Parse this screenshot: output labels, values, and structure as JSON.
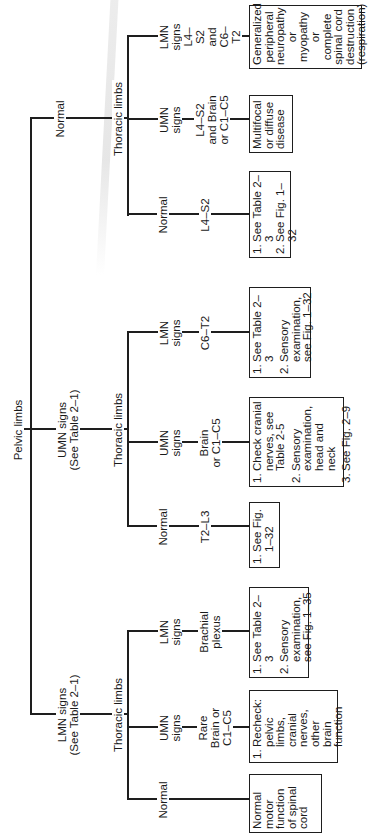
{
  "root": {
    "label": "Pelvic limbs"
  },
  "branches": [
    {
      "pelvic_label": "LMN signs\n(See Table 2–1)",
      "thoracic_label": "Thoracic limbs",
      "children": [
        {
          "sign": "LMN\nsigns",
          "location": "L4–S2\nand\nC6–T2",
          "box": "Generalized\nperipheral\nneuropathy\nor myopathy\nor\ncomplete\nspinal cord\ndestruction\n(respiration)"
        },
        {
          "sign": "UMN\nsigns",
          "location": "L4–S2\nand Brain\nor C1–C5",
          "box": "Multifocal\nor diffuse\ndisease"
        },
        {
          "sign": "Normal",
          "location": "L4–S2",
          "box_items": [
            {
              "num": "1.",
              "text": "See Table 2–3"
            },
            {
              "num": "2.",
              "text": "See Fig. 1–32"
            }
          ]
        }
      ]
    },
    {
      "pelvic_label": "UMN signs\n(See Table 2–1)",
      "thoracic_label": "Thoracic limbs",
      "children": [
        {
          "sign": "LMN\nsigns",
          "location": "C6–T2",
          "box_items": [
            {
              "num": "1.",
              "text": "See Table 2–3"
            },
            {
              "num": "2.",
              "text": "Sensory\nexamination,\nsee Fig. 1–32"
            }
          ]
        },
        {
          "sign": "UMN\nsigns",
          "location": "Brain\nor C1–C5",
          "box_items": [
            {
              "num": "1.",
              "text": "Check cranial\nnerves, see\nTable 2-5"
            },
            {
              "num": "2.",
              "text": "Sensory\nexamination,\nhead and\nneck"
            },
            {
              "num": "3.",
              "text": "See Fig. 2–9"
            }
          ]
        },
        {
          "sign": "Normal",
          "location": "T2–L3",
          "box_items": [
            {
              "num": "1.",
              "text": "See Fig.\n1–32"
            }
          ]
        }
      ]
    },
    {
      "pelvic_label": "Normal",
      "thoracic_label": "Thoracic limbs",
      "children": [
        {
          "sign": "LMN\nsigns",
          "location": "Brachial\nplexus",
          "box_items": [
            {
              "num": "1.",
              "text": "See Table 2–3"
            },
            {
              "num": "2.",
              "text": "Sensory\nexamination,\nsee Fig. 1–35"
            }
          ]
        },
        {
          "sign": "UMN\nsigns",
          "location": "Rare\nBrain or\nC1–C5",
          "box_items": [
            {
              "num": "1.",
              "text": "Recheck:\npelvic\nlimbs,\ncranial\nnerves,\nother brain\nfunction"
            }
          ]
        },
        {
          "sign": "Normal",
          "location": "",
          "box": "Normal\nmotor\nfunction\nof spinal\ncord"
        }
      ]
    }
  ]
}
